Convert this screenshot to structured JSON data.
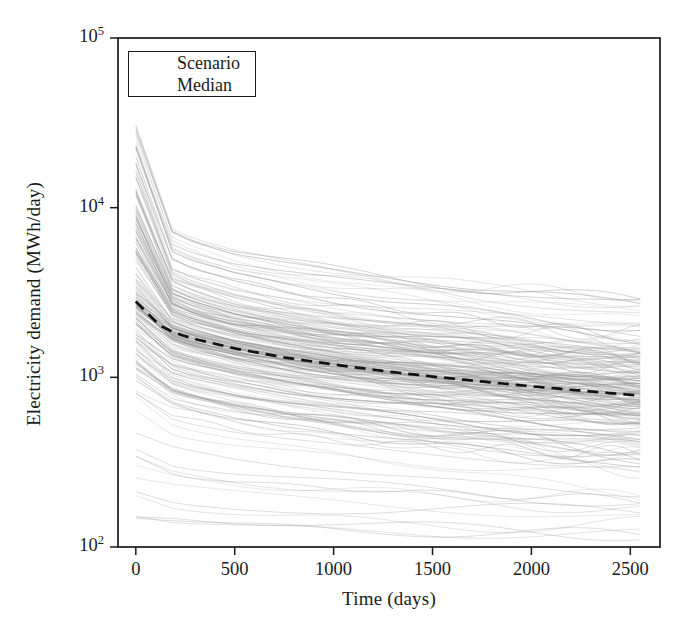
{
  "chart_data": {
    "type": "line",
    "title": "",
    "xlabel": "Time (days)",
    "ylabel": "Electricity demand (MWh/day)",
    "xlim": [
      -90,
      2650
    ],
    "ylim": [
      100,
      100000
    ],
    "yscale": "log",
    "xscale": "linear",
    "grid": false,
    "xticks": [
      0,
      500,
      1000,
      1500,
      2000,
      2500
    ],
    "xticklabels": [
      "0",
      "500",
      "1000",
      "1500",
      "2000",
      "2500"
    ],
    "yticks": [
      100,
      1000,
      10000,
      100000
    ],
    "yticklabels": [
      "10",
      "10",
      "10",
      "10"
    ],
    "yticklabel_exponents": [
      "2",
      "3",
      "4",
      "5"
    ],
    "legend": {
      "position": "upper left",
      "entries": [
        {
          "label": "Scenario",
          "style": "solid",
          "color": "#9a9a9a",
          "width": 0.6
        },
        {
          "label": "Median",
          "style": "dashed",
          "color": "#111111",
          "width": 2.6
        }
      ]
    },
    "series_count": 200,
    "series_description": "200 stochastic electricity-demand decay scenarios, each decaying monotonically from its t=0 start value toward a plateau by t=2550 days",
    "x": [
      0,
      50,
      100,
      200,
      300,
      500,
      750,
      1000,
      1250,
      1500,
      1750,
      2000,
      2250,
      2550
    ],
    "scenario_envelope": {
      "max": [
        31000,
        12000,
        9200,
        7600,
        6800,
        5800,
        5100,
        4600,
        4200,
        3900,
        3600,
        3400,
        3200,
        3000
      ],
      "p90": [
        17000,
        6400,
        5000,
        4100,
        3700,
        3150,
        2800,
        2500,
        2300,
        2150,
        2000,
        1900,
        1800,
        1700
      ],
      "p75": [
        9000,
        4300,
        3500,
        2950,
        2680,
        2300,
        2050,
        1850,
        1700,
        1580,
        1490,
        1410,
        1340,
        1270
      ],
      "p25": [
        1500,
        1250,
        1130,
        1000,
        930,
        830,
        740,
        680,
        630,
        590,
        555,
        525,
        500,
        470
      ],
      "p10": [
        700,
        620,
        575,
        520,
        490,
        440,
        400,
        370,
        345,
        325,
        310,
        295,
        282,
        268
      ],
      "min": [
        150,
        148,
        146,
        143,
        141,
        138,
        136,
        134,
        132,
        131,
        130,
        129,
        128,
        127
      ]
    },
    "median": {
      "name": "Median",
      "x": [
        0,
        50,
        100,
        200,
        300,
        500,
        750,
        1000,
        1250,
        1500,
        1750,
        2000,
        2250,
        2550
      ],
      "values": [
        2800,
        2350,
        2080,
        1820,
        1680,
        1480,
        1310,
        1190,
        1090,
        1010,
        945,
        885,
        835,
        780
      ]
    }
  },
  "legend": {
    "scenario_label": "Scenario",
    "median_label": "Median"
  },
  "axes": {
    "x_title": "Time (days)",
    "y_title": "Electricity demand (MWh/day)",
    "x_tick_labels": [
      "0",
      "500",
      "1000",
      "1500",
      "2000",
      "2500"
    ],
    "y_tick_mantissa": "10",
    "y_tick_exponents": [
      "5",
      "4",
      "3",
      "2"
    ]
  },
  "colors": {
    "axis": "#1a1a1a",
    "scenario": "#8f8f8f",
    "median": "#111111",
    "background": "#ffffff"
  }
}
